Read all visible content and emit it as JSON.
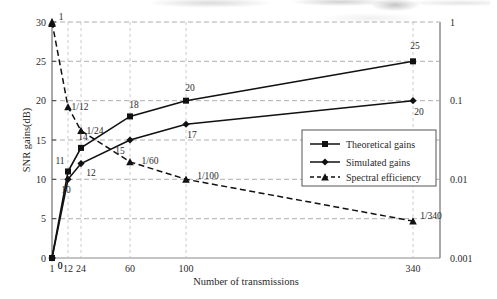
{
  "chart_data": {
    "type": "line",
    "title": "",
    "xlabel": "Number of transmissions",
    "ylabel": "SNR gains(dB)",
    "y2label": "",
    "categories": [
      "1",
      "12",
      "24",
      "60",
      "100",
      "340"
    ],
    "x": [
      1,
      12,
      24,
      60,
      100,
      340
    ],
    "ylim": [
      0,
      30
    ],
    "yticks": [
      "0",
      "5",
      "10",
      "15",
      "20",
      "25",
      "30"
    ],
    "y2lim": [
      0.001,
      1
    ],
    "y2scale": "log",
    "y2ticks": [
      "1",
      "0.1",
      "0.01",
      "0.001"
    ],
    "xticks": [
      "1",
      "12",
      "24",
      "60",
      "100",
      "340"
    ],
    "grid": true,
    "legend_position": "center-right",
    "series": [
      {
        "name": "Theoretical gains",
        "axis": "left",
        "marker": "square",
        "line": "solid",
        "values": [
          0,
          11,
          14,
          18,
          20,
          25
        ],
        "point_labels": [
          "0",
          "11",
          "14",
          "18",
          "20",
          "25"
        ]
      },
      {
        "name": "Simulated gains",
        "axis": "left",
        "marker": "diamond",
        "line": "solid",
        "values": [
          0,
          10,
          12,
          15,
          17,
          20
        ],
        "point_labels": [
          "0",
          "10",
          "12",
          "15",
          "17",
          "20"
        ]
      },
      {
        "name": "Spectral efficiency",
        "axis": "right",
        "marker": "triangle",
        "line": "dashed",
        "values": [
          1,
          0.08333,
          0.04167,
          0.01667,
          0.01,
          0.002941
        ],
        "point_labels": [
          "1",
          "1/12",
          "1/24",
          "1/60",
          "1/100",
          "1/340"
        ]
      }
    ],
    "colors": {
      "line": "#111111",
      "grid": "#9a9a9a",
      "axis": "#4a4a4a",
      "text": "#2a2a2a",
      "background": "#ffffff"
    }
  },
  "legend": {
    "items": [
      {
        "label": "Theoretical gains"
      },
      {
        "label": "Simulated gains"
      },
      {
        "label": "Spectral efficiency"
      }
    ]
  }
}
